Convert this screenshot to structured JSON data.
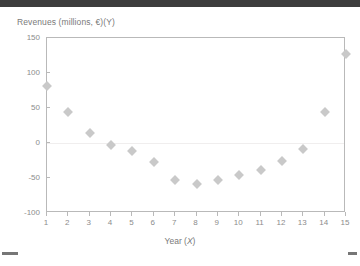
{
  "top_band": {
    "color": "#3d3d3d"
  },
  "chart_data": {
    "type": "scatter",
    "title": "Revenues (millions, €)(Y)",
    "xlabel": "Year (X)",
    "ylabel": "Revenues (millions, €)",
    "x": [
      1,
      2,
      3,
      4,
      5,
      6,
      7,
      8,
      9,
      10,
      11,
      12,
      13,
      14,
      15
    ],
    "values": [
      82,
      44,
      14,
      -3,
      -11,
      -27,
      -53,
      -59,
      -53,
      -46,
      -39,
      -26,
      -8,
      45,
      127
    ],
    "xticklabels": [
      "1",
      "2",
      "3",
      "4",
      "5",
      "6",
      "7",
      "8",
      "9",
      "10",
      "11",
      "12",
      "13",
      "14",
      "15"
    ],
    "yticklabels": [
      "150",
      "100",
      "50",
      "0",
      "-50",
      "-100"
    ],
    "yticks": [
      150,
      100,
      50,
      0,
      -50,
      -100
    ],
    "xlim": [
      1,
      15
    ],
    "ylim": [
      -100,
      150
    ],
    "grid": true,
    "gridlines_at": [
      0
    ],
    "legend": null,
    "marker": "diamond",
    "marker_color": "#c9c9c9",
    "axis_color": "#b9b9b9",
    "text_color": "#8c8c8c"
  },
  "footer": {
    "dash_left": "",
    "dash_right": ""
  }
}
